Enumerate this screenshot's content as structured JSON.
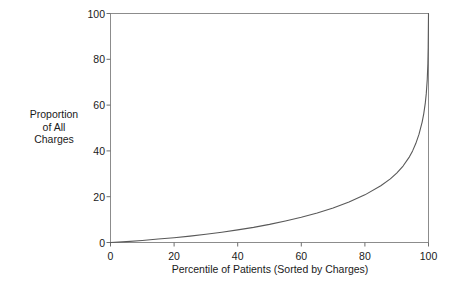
{
  "chart_data": {
    "type": "line",
    "title": "",
    "xlabel": "Percentile of Patients (Sorted by Charges)",
    "ylabel": "Proportion of All Charges",
    "ylabel_lines": [
      "Proportion",
      "of All",
      "Charges"
    ],
    "xlim": [
      0,
      100
    ],
    "ylim": [
      0,
      100
    ],
    "xticks": [
      0,
      20,
      40,
      60,
      80,
      100
    ],
    "yticks": [
      0,
      20,
      40,
      60,
      80,
      100
    ],
    "xtick_labels": [
      "0",
      "20",
      "40",
      "60",
      "80",
      "100"
    ],
    "ytick_labels": [
      "0",
      "20",
      "40",
      "60",
      "80",
      "100"
    ],
    "grid": false,
    "legend": false,
    "legend_position": "none",
    "line_color": "#595959",
    "line_width": 1,
    "frame_color": "#8c8c8c",
    "background_color": "#ffffff",
    "series": [
      {
        "name": "Cumulative proportion of all charges",
        "x": [
          0,
          5,
          10,
          15,
          20,
          25,
          30,
          35,
          40,
          45,
          50,
          55,
          60,
          65,
          70,
          75,
          80,
          85,
          88,
          90,
          92,
          94,
          95,
          96,
          97,
          98,
          98.5,
          99,
          99.3,
          99.6,
          99.8,
          99.9,
          100
        ],
        "values": [
          0,
          0.4,
          0.9,
          1.5,
          2.1,
          2.8,
          3.6,
          4.5,
          5.5,
          6.6,
          7.9,
          9.4,
          11.0,
          12.9,
          15.1,
          17.7,
          20.8,
          24.8,
          27.8,
          30.3,
          33.4,
          37.4,
          40.0,
          43.2,
          47.2,
          52.6,
          56.2,
          61.0,
          65.0,
          71.0,
          78.0,
          85.0,
          100
        ]
      }
    ]
  }
}
